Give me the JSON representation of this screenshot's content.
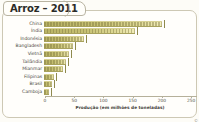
{
  "title": {
    "text": "Arroz – 2011"
  },
  "axis": {
    "caption": "Produção (em milhões de toneladas)",
    "ticks": [
      "0",
      "50",
      "100",
      "150",
      "200",
      "250"
    ]
  },
  "credit": "©",
  "colors": {
    "bar_dark": "#b9b466",
    "bar_light": "#f2edb9",
    "frame": "#cdc8b4",
    "text": "#4c4a42",
    "background": "#fffefb"
  },
  "chart_data": {
    "type": "bar",
    "orientation": "horizontal",
    "title": "Arroz – 2011",
    "xlabel": "Produção (em milhões de toneladas)",
    "ylabel": "",
    "xlim": [
      0,
      260
    ],
    "grid": false,
    "legend": "none",
    "categories": [
      "China",
      "Índia",
      "Indonésia",
      "Bangladesh",
      "Vietnã",
      "Tailândia",
      "Mianmar",
      "Filipinas",
      "Brasil",
      "Camboja"
    ],
    "values": [
      202,
      155,
      68,
      50,
      42,
      38,
      33,
      17,
      13,
      9
    ]
  }
}
